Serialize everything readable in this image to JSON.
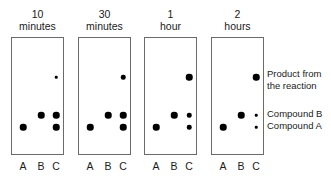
{
  "diagram": {
    "lane_labels": [
      "A",
      "B",
      "C"
    ],
    "ink_color": "#000000",
    "plate_border_color": "#6b6b6b",
    "panels": [
      {
        "header_line1": "10",
        "header_line2": "minutes",
        "spots": [
          {
            "lane": "C",
            "level": "product",
            "size": "tiny"
          },
          {
            "lane": "B",
            "level": "compound-b",
            "size": "medium"
          },
          {
            "lane": "C",
            "level": "compound-b",
            "size": "medium"
          },
          {
            "lane": "A",
            "level": "compound-a",
            "size": "medium"
          },
          {
            "lane": "C",
            "level": "compound-a",
            "size": "medium"
          }
        ]
      },
      {
        "header_line1": "30",
        "header_line2": "minutes",
        "spots": [
          {
            "lane": "C",
            "level": "product",
            "size": "small"
          },
          {
            "lane": "B",
            "level": "compound-b",
            "size": "medium"
          },
          {
            "lane": "C",
            "level": "compound-b",
            "size": "medium"
          },
          {
            "lane": "A",
            "level": "compound-a",
            "size": "medium"
          },
          {
            "lane": "C",
            "level": "compound-a",
            "size": "medium"
          }
        ]
      },
      {
        "header_line1": "1",
        "header_line2": "hour",
        "spots": [
          {
            "lane": "C",
            "level": "product",
            "size": "medium"
          },
          {
            "lane": "B",
            "level": "compound-b",
            "size": "medium"
          },
          {
            "lane": "C",
            "level": "compound-b",
            "size": "small"
          },
          {
            "lane": "A",
            "level": "compound-a",
            "size": "medium"
          },
          {
            "lane": "C",
            "level": "compound-a",
            "size": "small"
          }
        ]
      },
      {
        "header_line1": "2",
        "header_line2": "hours",
        "spots": [
          {
            "lane": "C",
            "level": "product",
            "size": "medium"
          },
          {
            "lane": "B",
            "level": "compound-b",
            "size": "medium"
          },
          {
            "lane": "C",
            "level": "compound-b",
            "size": "tiny"
          },
          {
            "lane": "A",
            "level": "compound-a",
            "size": "medium"
          },
          {
            "lane": "C",
            "level": "compound-a",
            "size": "tiny"
          }
        ]
      }
    ],
    "legend": {
      "product_line1": "Product from",
      "product_line2": "the reaction",
      "compound_b": "Compound B",
      "compound_a": "Compound A"
    }
  },
  "geometry": {
    "plate_left": [
      11,
      78,
      144,
      211
    ],
    "plate_top": 37,
    "plate_width": 53,
    "plate_height": 118,
    "lane_offsets": {
      "A": 11,
      "B": 29,
      "C": 44
    },
    "level_offsets": {
      "product": 39,
      "compound-b": 77,
      "compound-a": 89
    },
    "spot_sizes": {
      "tiny": 2.5,
      "small": 4.5,
      "medium": 6.5
    },
    "header_top": 8,
    "lane_label_top": 160,
    "legend_left": 267,
    "legend_product_top": 68,
    "legend_compound_b_top": 108
  }
}
